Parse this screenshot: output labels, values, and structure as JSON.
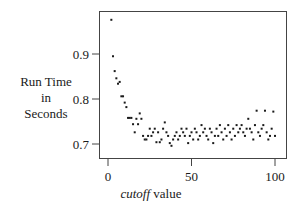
{
  "chart_data": {
    "type": "scatter",
    "title": "",
    "xlabel": "cutoff value",
    "xlabel_italic_part": "cutoff",
    "xlabel_rest": "value",
    "ylabel": "Run Time in Seconds",
    "ylabel_lines": [
      "Run Time",
      "in",
      "Seconds"
    ],
    "xlim": [
      -5,
      107
    ],
    "ylim": [
      0.67,
      0.99
    ],
    "xticks": [
      0,
      50,
      100
    ],
    "xtick_labels": [
      "0",
      "50",
      "100"
    ],
    "yticks": [
      0.7,
      0.8,
      0.9
    ],
    "ytick_labels": [
      "0.7",
      "0.8",
      "0.9"
    ],
    "grid": false,
    "legend": null,
    "series": [
      {
        "name": "run time",
        "color": "#1a1a1a",
        "points": [
          [
            2,
            0.976
          ],
          [
            3,
            0.895
          ],
          [
            4,
            0.862
          ],
          [
            5,
            0.846
          ],
          [
            6,
            0.834
          ],
          [
            7,
            0.838
          ],
          [
            8,
            0.806
          ],
          [
            9,
            0.806
          ],
          [
            10,
            0.792
          ],
          [
            11,
            0.782
          ],
          [
            12,
            0.758
          ],
          [
            13,
            0.758
          ],
          [
            14,
            0.758
          ],
          [
            15,
            0.744
          ],
          [
            16,
            0.726
          ],
          [
            17,
            0.756
          ],
          [
            18,
            0.744
          ],
          [
            19,
            0.768
          ],
          [
            20,
            0.756
          ],
          [
            21,
            0.718
          ],
          [
            22,
            0.71
          ],
          [
            23,
            0.71
          ],
          [
            24,
            0.718
          ],
          [
            25,
            0.734
          ],
          [
            26,
            0.718
          ],
          [
            27,
            0.726
          ],
          [
            28,
            0.734
          ],
          [
            29,
            0.704
          ],
          [
            30,
            0.726
          ],
          [
            31,
            0.704
          ],
          [
            32,
            0.71
          ],
          [
            33,
            0.734
          ],
          [
            34,
            0.748
          ],
          [
            35,
            0.726
          ],
          [
            36,
            0.718
          ],
          [
            37,
            0.702
          ],
          [
            38,
            0.696
          ],
          [
            39,
            0.71
          ],
          [
            40,
            0.718
          ],
          [
            41,
            0.726
          ],
          [
            42,
            0.71
          ],
          [
            43,
            0.718
          ],
          [
            44,
            0.734
          ],
          [
            45,
            0.726
          ],
          [
            46,
            0.718
          ],
          [
            47,
            0.734
          ],
          [
            48,
            0.702
          ],
          [
            49,
            0.718
          ],
          [
            50,
            0.726
          ],
          [
            51,
            0.71
          ],
          [
            52,
            0.734
          ],
          [
            53,
            0.726
          ],
          [
            54,
            0.71
          ],
          [
            55,
            0.718
          ],
          [
            56,
            0.742
          ],
          [
            57,
            0.726
          ],
          [
            58,
            0.734
          ],
          [
            59,
            0.718
          ],
          [
            60,
            0.71
          ],
          [
            61,
            0.734
          ],
          [
            62,
            0.726
          ],
          [
            63,
            0.702
          ],
          [
            64,
            0.718
          ],
          [
            65,
            0.734
          ],
          [
            66,
            0.718
          ],
          [
            67,
            0.742
          ],
          [
            68,
            0.726
          ],
          [
            69,
            0.71
          ],
          [
            70,
            0.734
          ],
          [
            71,
            0.718
          ],
          [
            72,
            0.742
          ],
          [
            73,
            0.726
          ],
          [
            74,
            0.71
          ],
          [
            75,
            0.734
          ],
          [
            76,
            0.718
          ],
          [
            77,
            0.742
          ],
          [
            78,
            0.726
          ],
          [
            79,
            0.734
          ],
          [
            80,
            0.742
          ],
          [
            81,
            0.726
          ],
          [
            82,
            0.718
          ],
          [
            83,
            0.734
          ],
          [
            84,
            0.756
          ],
          [
            85,
            0.734
          ],
          [
            86,
            0.726
          ],
          [
            87,
            0.71
          ],
          [
            88,
            0.742
          ],
          [
            89,
            0.774
          ],
          [
            90,
            0.726
          ],
          [
            91,
            0.718
          ],
          [
            92,
            0.734
          ],
          [
            93,
            0.742
          ],
          [
            94,
            0.774
          ],
          [
            95,
            0.726
          ],
          [
            96,
            0.71
          ],
          [
            97,
            0.718
          ],
          [
            98,
            0.734
          ],
          [
            99,
            0.772
          ],
          [
            100,
            0.718
          ]
        ]
      }
    ]
  },
  "labels": {
    "ylabel_line1": "Run Time",
    "ylabel_line2": "in",
    "ylabel_line3": "Seconds",
    "xlabel_italic": "cutoff",
    "xlabel_rest": " value"
  }
}
